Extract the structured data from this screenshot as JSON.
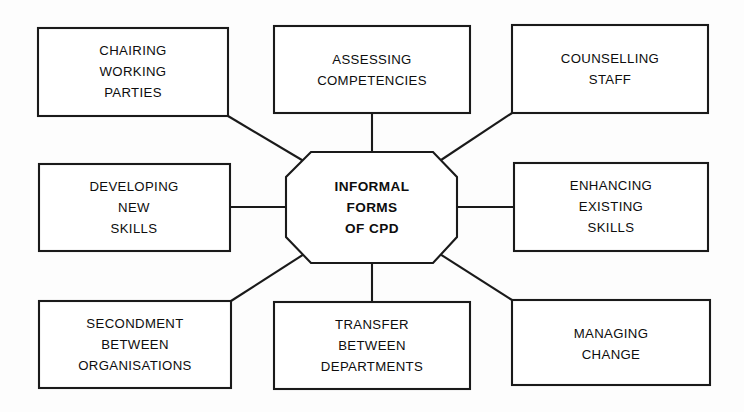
{
  "diagram": {
    "type": "hub-and-spoke-octagon",
    "title": "Informal Forms of CPD",
    "background_color": "#fdfdfd",
    "line_color": "#1a1a1a",
    "text_color": "#0d0d0d",
    "center": {
      "shape": "octagon",
      "lines": [
        "INFORMAL",
        "FORMS",
        "OF CPD"
      ],
      "bold": true
    },
    "nodes": [
      {
        "id": "chairing-working-parties",
        "position": "top-left",
        "shape": "rectangle",
        "lines": [
          "CHAIRING",
          "WORKING",
          "PARTIES"
        ]
      },
      {
        "id": "assessing-competencies",
        "position": "top-center",
        "shape": "rectangle",
        "lines": [
          "ASSESSING",
          "COMPETENCIES"
        ]
      },
      {
        "id": "counselling-staff",
        "position": "top-right",
        "shape": "rectangle",
        "lines": [
          "COUNSELLING",
          "STAFF"
        ]
      },
      {
        "id": "developing-new-skills",
        "position": "middle-left",
        "shape": "rectangle",
        "lines": [
          "DEVELOPING",
          "NEW",
          "SKILLS"
        ]
      },
      {
        "id": "enhancing-existing-skills",
        "position": "middle-right",
        "shape": "rectangle",
        "lines": [
          "ENHANCING",
          "EXISTING",
          "SKILLS"
        ]
      },
      {
        "id": "secondment-between-organisations",
        "position": "bottom-left",
        "shape": "rectangle",
        "lines": [
          "SECONDMENT",
          "BETWEEN",
          "ORGANISATIONS"
        ]
      },
      {
        "id": "transfer-between-departments",
        "position": "bottom-center",
        "shape": "rectangle",
        "lines": [
          "TRANSFER",
          "BETWEEN",
          "DEPARTMENTS"
        ]
      },
      {
        "id": "managing-change",
        "position": "bottom-right",
        "shape": "rectangle",
        "lines": [
          "MANAGING",
          "CHANGE"
        ]
      }
    ],
    "connectors": [
      {
        "from": "chairing-working-parties",
        "to": "center",
        "kind": "diagonal"
      },
      {
        "from": "assessing-competencies",
        "to": "center",
        "kind": "vertical"
      },
      {
        "from": "counselling-staff",
        "to": "center",
        "kind": "diagonal"
      },
      {
        "from": "developing-new-skills",
        "to": "center",
        "kind": "horizontal"
      },
      {
        "from": "enhancing-existing-skills",
        "to": "center",
        "kind": "horizontal"
      },
      {
        "from": "secondment-between-organisations",
        "to": "center",
        "kind": "diagonal"
      },
      {
        "from": "transfer-between-departments",
        "to": "center",
        "kind": "vertical"
      },
      {
        "from": "managing-change",
        "to": "center",
        "kind": "diagonal"
      }
    ]
  }
}
